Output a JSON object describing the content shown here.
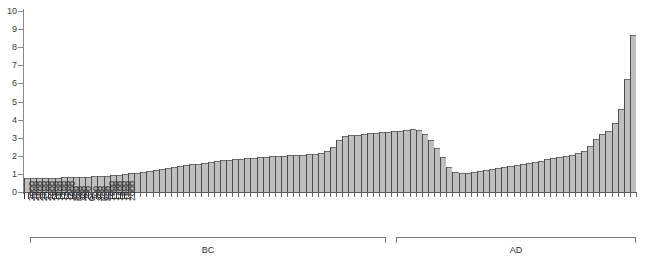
{
  "chart_data": {
    "type": "bar",
    "title": "",
    "subtitle": "",
    "xlabel": "",
    "ylabel": "",
    "ylim": [
      0,
      10
    ],
    "grid": false,
    "legend": null,
    "y_ticks": [
      "0",
      "1",
      "2",
      "3",
      "4",
      "5",
      "6",
      "7",
      "8",
      "9",
      "10"
    ],
    "x_tick_labels": [
      "3000",
      "2800",
      "2600",
      "2400",
      "2200",
      "2000",
      "1800",
      "1600",
      "1400",
      "1200",
      "1000",
      "800",
      "600",
      "400",
      "200",
      "0",
      "200",
      "400",
      "600",
      "800",
      "1000",
      "1200",
      "1400",
      "1600",
      "1800",
      "2000"
    ],
    "era_brackets": [
      {
        "label": "BC",
        "from": "3000",
        "to": "0"
      },
      {
        "label": "AD",
        "from": "0",
        "to": "2000"
      }
    ],
    "bar_color": "#bfbfbf",
    "bar_edge_color": "#4d4d4d",
    "axis_color": "#5a5a5a",
    "categories": [
      "-3000",
      "-2900",
      "-2800",
      "-2700",
      "-2600",
      "-2500",
      "-2400",
      "-2300",
      "-2200",
      "-2100",
      "-2000",
      "-1900",
      "-1800",
      "-1700",
      "-1600",
      "-1500",
      "-1400",
      "-1300",
      "-1200",
      "-1100",
      "-1000",
      "-900",
      "-800",
      "-700",
      "-600",
      "-500",
      "-400",
      "-300",
      "-200",
      "-100",
      "0",
      "100",
      "200",
      "300",
      "400",
      "500",
      "600",
      "700",
      "800",
      "900",
      "1000",
      "1100",
      "1200",
      "1300",
      "1400",
      "1500",
      "1600",
      "1700",
      "1800",
      "1900",
      "2000"
    ],
    "values": [
      0.8,
      0.8,
      0.8,
      0.8,
      0.82,
      0.84,
      0.88,
      0.92,
      0.98,
      1.05,
      1.15,
      1.25,
      1.35,
      1.45,
      1.55,
      1.65,
      1.75,
      1.8,
      1.85,
      1.9,
      1.95,
      2.0,
      2.05,
      2.08,
      2.12,
      2.3,
      3.05,
      3.15,
      3.25,
      3.3,
      3.35,
      3.4,
      3.5,
      3.1,
      2.2,
      1.1,
      1.05,
      1.15,
      1.25,
      1.35,
      1.45,
      1.55,
      1.7,
      1.85,
      1.95,
      2.1,
      2.35,
      3.15,
      3.45,
      5.0,
      9.9
    ]
  },
  "bars_detail": {
    "count": 100,
    "century_step": 50,
    "note": "rendered as 100 sub-bars interpolated across the 51 century anchors"
  }
}
